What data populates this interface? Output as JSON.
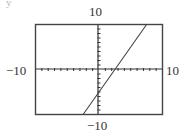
{
  "labels": {
    "ymax": "10",
    "ymin": "−10",
    "xmin": "−10",
    "xmax": "10",
    "corner": "y"
  },
  "chart_data": {
    "type": "line",
    "title": "",
    "xlabel": "",
    "ylabel": "",
    "xlim": [
      -10,
      10
    ],
    "ylim": [
      -10,
      10
    ],
    "xscale": 1,
    "yscale": 1,
    "grid": false,
    "tick_marks": "every 1 unit on both axes",
    "window_labels": {
      "xmin": "-10",
      "xmax": "10",
      "ymin": "-10",
      "ymax": "10"
    },
    "series": [
      {
        "name": "y = 2x - 5",
        "equation": "y = 2x - 5",
        "x": [
          -2.5,
          0,
          2.5,
          7.5
        ],
        "y": [
          -10,
          -5,
          0,
          10
        ]
      }
    ],
    "x_intercept": 2.5,
    "y_intercept": -5
  }
}
